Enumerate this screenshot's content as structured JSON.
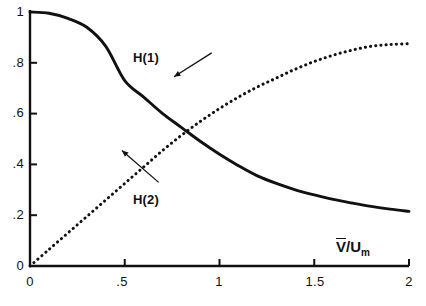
{
  "chart_data": {
    "type": "line",
    "title": "",
    "subtitle": "",
    "xlabel": "V̄/U_m",
    "xlabel_parts": {
      "numerator": "V",
      "overbar": true,
      "slash": "/",
      "denominator": "U",
      "subscript": "m"
    },
    "ylabel": "",
    "xlim": [
      0,
      2
    ],
    "ylim": [
      0,
      1
    ],
    "grid": false,
    "legend_position": "inline-annotations",
    "xticks": [
      0,
      0.5,
      1,
      1.5,
      2
    ],
    "xtick_labels": [
      "0",
      ".5",
      "1",
      "1.5",
      "2"
    ],
    "yticks": [
      0,
      0.2,
      0.4,
      0.6,
      0.8,
      1
    ],
    "ytick_labels": [
      "0",
      ".2",
      ".4",
      ".6",
      ".8",
      "1"
    ],
    "series": [
      {
        "name": "H(1)",
        "style": "solid",
        "color": "#111111",
        "annotation_label": "H(1)",
        "x": [
          0,
          0.1,
          0.2,
          0.3,
          0.4,
          0.5,
          0.6,
          0.7,
          0.8,
          0.9,
          1.0,
          1.1,
          1.2,
          1.3,
          1.4,
          1.5,
          1.6,
          1.7,
          1.8,
          1.9,
          2.0
        ],
        "y": [
          1.0,
          0.995,
          0.975,
          0.94,
          0.865,
          0.73,
          0.665,
          0.6,
          0.545,
          0.49,
          0.44,
          0.395,
          0.355,
          0.325,
          0.3,
          0.28,
          0.262,
          0.248,
          0.235,
          0.224,
          0.215
        ]
      },
      {
        "name": "H(2)",
        "style": "dotted",
        "color": "#111111",
        "annotation_label": "H(2)",
        "x": [
          0,
          0.1,
          0.2,
          0.3,
          0.4,
          0.5,
          0.6,
          0.7,
          0.8,
          0.9,
          1.0,
          1.1,
          1.2,
          1.3,
          1.4,
          1.5,
          1.6,
          1.7,
          1.8,
          1.9,
          2.0
        ],
        "y": [
          0.0,
          0.065,
          0.13,
          0.195,
          0.26,
          0.325,
          0.39,
          0.455,
          0.515,
          0.57,
          0.62,
          0.665,
          0.705,
          0.74,
          0.775,
          0.805,
          0.83,
          0.85,
          0.865,
          0.872,
          0.875
        ]
      }
    ],
    "annotations": [
      {
        "text": "H(1)",
        "x": 0.98,
        "y": 0.855,
        "leader_to_x": 0.76,
        "leader_to_y": 0.745
      },
      {
        "text": "H(2)",
        "x": 0.7,
        "y": 0.345,
        "leader_to_x": 0.485,
        "leader_to_y": 0.455
      }
    ],
    "intersection": {
      "x": 0.82,
      "y": 0.53
    }
  },
  "axes": {
    "x_tick_labels": [
      "0",
      ".5",
      "1",
      "1.5",
      "2"
    ],
    "y_tick_labels": [
      "0",
      ".2",
      ".4",
      ".6",
      ".8",
      "1"
    ]
  }
}
